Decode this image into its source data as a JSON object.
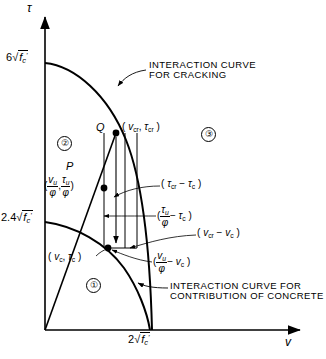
{
  "figure": {
    "type": "engineering-interaction-diagram",
    "axes": {
      "y_symbol": "τ",
      "x_symbol": "v",
      "y_ticks": [
        {
          "value": "6√f'c",
          "display_coefficient": "6",
          "radicand": "f'c"
        },
        {
          "value": "2.4√f'c",
          "display_coefficient": "2.4",
          "radicand": "f'c"
        }
      ],
      "x_ticks": [
        {
          "value": "2√f'c",
          "display_coefficient": "2",
          "radicand": "f'c"
        }
      ]
    },
    "curves": [
      {
        "name": "cracking",
        "caption_line1": "INTERACTION CURVE",
        "caption_line2": "FOR CRACKING"
      },
      {
        "name": "concrete-contribution",
        "caption_line1": "INTERACTION CURVE FOR",
        "caption_line2": "CONTRIBUTION OF CONCRETE"
      }
    ],
    "points": [
      {
        "id": "Q",
        "label": "Q",
        "coord": "( v_cr , τ_cr )"
      },
      {
        "id": "P",
        "label": "P",
        "coord": "( v_u/φ , τ_u/φ )"
      },
      {
        "id": "C",
        "label": "",
        "coord": "( v_c , τ_c )"
      }
    ],
    "regions": [
      {
        "id": "1",
        "glyph": "①"
      },
      {
        "id": "2",
        "glyph": "②"
      },
      {
        "id": "3",
        "glyph": "③"
      }
    ],
    "dimensions": [
      {
        "id": "tau-cr-minus-tau-c",
        "text": "( τ_cr − τ_c )"
      },
      {
        "id": "tau-u-over-phi-minus-tau-c",
        "text": "( τ_u/φ − τ_c )"
      },
      {
        "id": "v-cr-minus-v-c",
        "text": "( v_cr − v_c )"
      },
      {
        "id": "v-u-over-phi-minus-v-c",
        "text": "( v_u/φ − v_c )"
      }
    ]
  },
  "labels": {
    "y_axis": "τ",
    "x_axis": "v",
    "tick_y_top_coeff": "6",
    "tick_y_mid_coeff": "2.4",
    "tick_x_coeff": "2",
    "radicand": "f",
    "radicand_sub": "c",
    "radicand_prime": "'",
    "caption_cracking_1": "INTERACTION CURVE",
    "caption_cracking_2": "FOR CRACKING",
    "caption_concrete_1": "INTERACTION CURVE FOR",
    "caption_concrete_2": "CONTRIBUTION OF CONCRETE",
    "point_q": "Q",
    "point_p": "P",
    "region_1": "①",
    "region_2": "②",
    "region_3": "③",
    "v": "v",
    "tau": "τ",
    "phi": "φ",
    "sub_cr": "cr",
    "sub_c": "c",
    "sub_u": "u",
    "open_paren": "(",
    "close_paren": ")",
    "comma": ",",
    "minus": "−"
  },
  "colors": {
    "ink": "#000000",
    "background": "#ffffff"
  }
}
